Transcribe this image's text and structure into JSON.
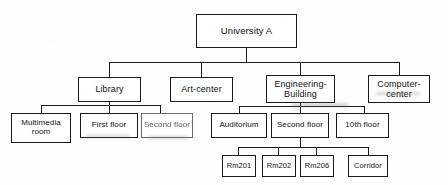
{
  "diagram": {
    "type": "tree",
    "ink_color": "#1a1a1a",
    "background_color": "#fefefe",
    "nodes": {
      "root": {
        "label": "University A"
      },
      "library": {
        "label": "Library"
      },
      "art_center": {
        "label": "Art-center"
      },
      "engineering_building": {
        "label": "Engineering-\nBuilding"
      },
      "computer_center": {
        "label": "Computer-\ncenter"
      },
      "multimedia_room": {
        "label": "Multimedia\nroom"
      },
      "first_floor": {
        "label": "First floor"
      },
      "second_floor_lib": {
        "label": "Second floor"
      },
      "auditorium": {
        "label": "Auditorium"
      },
      "second_floor_eng": {
        "label": "Second floor"
      },
      "tenth_floor": {
        "label": "10th floor"
      },
      "rm201": {
        "label": "Rm201"
      },
      "rm202": {
        "label": "Rm202"
      },
      "rm206": {
        "label": "Rm206"
      },
      "corridor": {
        "label": "Corridor"
      }
    },
    "hierarchy": [
      {
        "label": "University A",
        "children": [
          {
            "label": "Library",
            "children": [
              {
                "label": "Multimedia room"
              },
              {
                "label": "First floor"
              },
              {
                "label": "Second floor"
              }
            ]
          },
          {
            "label": "Art-center"
          },
          {
            "label": "Engineering-Building",
            "children": [
              {
                "label": "Auditorium"
              },
              {
                "label": "Second floor",
                "children": [
                  {
                    "label": "Rm201"
                  },
                  {
                    "label": "Rm202"
                  },
                  {
                    "label": "Rm206"
                  },
                  {
                    "label": "Corridor"
                  }
                ]
              },
              {
                "label": "10th floor"
              }
            ]
          },
          {
            "label": "Computer-center"
          }
        ]
      }
    ]
  }
}
